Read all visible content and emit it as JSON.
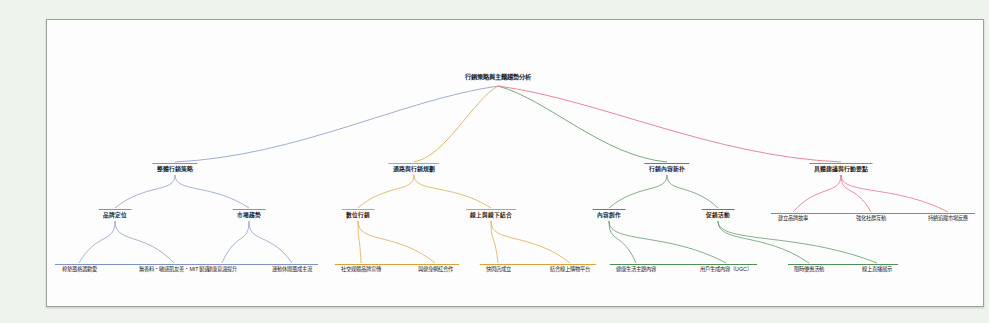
{
  "diagram": {
    "title": "行銷策略與主題趨勢分析",
    "type": "mindmap-tree",
    "colors": {
      "background": "#eef3ed",
      "canvas": "#fdfdfd",
      "border": "#9aa29a",
      "branch_blue": "#7f93c6",
      "branch_orange": "#d8a33c",
      "branch_green": "#4f8f56",
      "branch_red": "#e0607a",
      "text": "#1d1d1d"
    }
  },
  "root": {
    "label": "行銷策略與主題趨勢分析",
    "x": 451,
    "y": 54
  },
  "branches": [
    {
      "id": "branch-blue",
      "color": "#7f93c6",
      "label": "整體行銷策略",
      "x": 128,
      "y": 143,
      "children": [
        {
          "label": "品牌定位",
          "x": 68,
          "y": 189,
          "leaves": [
            {
              "label": "棉墊風格選歡愛",
              "x": 32,
              "y": 240
            },
            {
              "label": "無香料・敏感肌友善・MIT製造",
              "x": 127,
              "y": 240
            }
          ]
        },
        {
          "label": "市場趨勢",
          "x": 202,
          "y": 189,
          "leaves": [
            {
              "label": "健康意識提升",
              "x": 175,
              "y": 240
            },
            {
              "label": "運動休閒風成主流",
              "x": 245,
              "y": 240
            }
          ]
        }
      ]
    },
    {
      "id": "branch-orange",
      "color": "#d8a33c",
      "label": "通路與行銷規劃",
      "x": 367,
      "y": 143,
      "children": [
        {
          "label": "數位行銷",
          "x": 311,
          "y": 189,
          "leaves": [
            {
              "label": "社交媒體品牌宣傳",
              "x": 314,
              "y": 240
            },
            {
              "label": "與健身網紅合作",
              "x": 388,
              "y": 240
            }
          ]
        },
        {
          "label": "線上與線下結合",
          "x": 444,
          "y": 189,
          "leaves": [
            {
              "label": "快閃店成立",
              "x": 451,
              "y": 240
            },
            {
              "label": "結合線上購物平台",
              "x": 523,
              "y": 240
            }
          ]
        }
      ]
    },
    {
      "id": "branch-green",
      "color": "#4f8f56",
      "label": "行銷內容新扑",
      "x": 620,
      "y": 143,
      "children": [
        {
          "label": "內容創作",
          "x": 562,
          "y": 189,
          "leaves": [
            {
              "label": "健康生活主題內容",
              "x": 589,
              "y": 240
            },
            {
              "label": "用戶生成內容（UGC）",
              "x": 679,
              "y": 240
            }
          ]
        },
        {
          "label": "促銷活動",
          "x": 671,
          "y": 189,
          "leaves": [
            {
              "label": "限時優惠活動",
              "x": 762,
              "y": 240
            },
            {
              "label": "線上直播展示",
              "x": 830,
              "y": 240
            }
          ]
        }
      ]
    },
    {
      "id": "branch-red",
      "color": "#e0607a",
      "label": "具體建議與行動要點",
      "x": 794,
      "y": 143,
      "children": [],
      "leaves": [
        {
          "label": "建立品牌故事",
          "x": 746,
          "y": 189
        },
        {
          "label": "強化社群互動",
          "x": 824,
          "y": 189
        },
        {
          "label": "持續追蹤市場反應",
          "x": 901,
          "y": 189
        }
      ]
    }
  ]
}
